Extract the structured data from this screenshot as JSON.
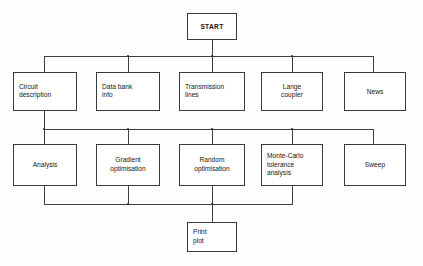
{
  "diagram": {
    "background_color": "#fdfdfc",
    "line_color": "#3f3f3f",
    "box_border_color": "#3a3a3a",
    "box_fill_color": "#ffffff",
    "text_color": "#141414"
  },
  "nodes": {
    "start": {
      "label": "START",
      "align": "center"
    },
    "row1": [
      {
        "label": "Circuit\ndescription",
        "align": "left"
      },
      {
        "label": "Data bank\ninfo",
        "align": "left"
      },
      {
        "label": "Transmission\nlines",
        "align": "left"
      },
      {
        "label": "Lange\ncoupler",
        "align": "center"
      },
      {
        "label": "News",
        "align": "center"
      }
    ],
    "row2": [
      {
        "label": "Analysis",
        "align": "center"
      },
      {
        "label": "Gradient\noptimisation",
        "align": "center"
      },
      {
        "label": "Random\noptimisation",
        "align": "center"
      },
      {
        "label": "Monte-Carlo\ntolerance\nanalysis",
        "align": "left"
      },
      {
        "label": "Sweep",
        "align": "center"
      }
    ],
    "end": {
      "label": "Print\nplot",
      "align": "left"
    }
  }
}
